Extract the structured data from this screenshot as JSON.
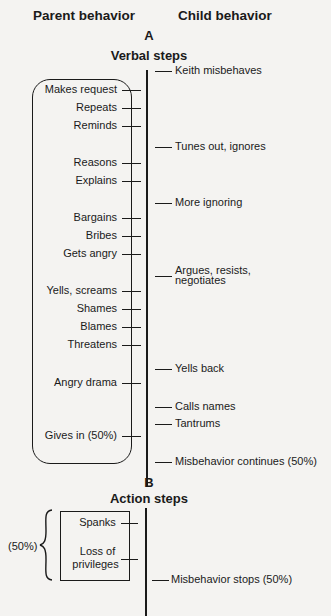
{
  "headers": {
    "parent": "Parent behavior",
    "child": "Child behavior"
  },
  "section_a": {
    "letter": "A",
    "title": "Verbal steps",
    "parent_steps": [
      {
        "label": "Makes request",
        "y": 90
      },
      {
        "label": "Repeats",
        "y": 108
      },
      {
        "label": "Reminds",
        "y": 126
      },
      {
        "label": "Reasons",
        "y": 163
      },
      {
        "label": "Explains",
        "y": 181
      },
      {
        "label": "Bargains",
        "y": 218
      },
      {
        "label": "Bribes",
        "y": 236
      },
      {
        "label": "Gets angry",
        "y": 254
      },
      {
        "label": "Yells, screams",
        "y": 291
      },
      {
        "label": "Shames",
        "y": 309
      },
      {
        "label": "Blames",
        "y": 327
      },
      {
        "label": "Threatens",
        "y": 345
      },
      {
        "label": "Angry drama",
        "y": 383
      },
      {
        "label": "Gives in (50%)",
        "y": 436
      }
    ],
    "child_responses": [
      {
        "label": "Keith misbehaves",
        "y": 71
      },
      {
        "label": "Tunes out, ignores",
        "y": 147
      },
      {
        "label": "More ignoring",
        "y": 203
      },
      {
        "label": "Argues, resists,",
        "label2": "negotiates",
        "y": 276
      },
      {
        "label": "Yells back",
        "y": 369
      },
      {
        "label": "Calls names",
        "y": 407
      },
      {
        "label": "Tantrums",
        "y": 424
      },
      {
        "label": "Misbehavior continues (50%)",
        "y": 462
      }
    ]
  },
  "section_b": {
    "letter": "B",
    "title": "Action steps",
    "brace_label": "(50%)",
    "parent_steps": [
      {
        "label": "Spanks",
        "y": 523
      },
      {
        "label": "Loss of",
        "label2": "privileges",
        "y": 559
      }
    ],
    "child_responses": [
      {
        "label": "Misbehavior stops (50%)",
        "y": 580
      }
    ]
  }
}
